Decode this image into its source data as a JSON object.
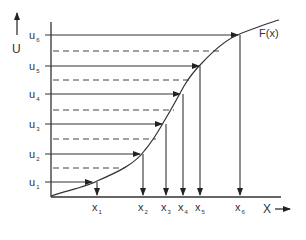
{
  "diagram": {
    "y_axis": {
      "label": "U"
    },
    "x_axis": {
      "label": "X"
    },
    "curve_label": "F(x)",
    "u_levels": [
      {
        "name": "u",
        "sub": "1"
      },
      {
        "name": "u",
        "sub": "2"
      },
      {
        "name": "u",
        "sub": "3"
      },
      {
        "name": "u",
        "sub": "4"
      },
      {
        "name": "u",
        "sub": "5"
      },
      {
        "name": "u",
        "sub": "6"
      }
    ],
    "x_values": [
      {
        "name": "x",
        "sub": "1"
      },
      {
        "name": "x",
        "sub": "2"
      },
      {
        "name": "x",
        "sub": "3"
      },
      {
        "name": "x",
        "sub": "4"
      },
      {
        "name": "x",
        "sub": "5"
      },
      {
        "name": "x",
        "sub": "6"
      }
    ],
    "colors": {
      "line": "#333333",
      "background": "#ffffff"
    }
  }
}
